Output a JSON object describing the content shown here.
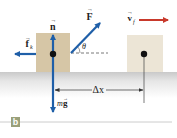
{
  "figure": {
    "part_label": "b",
    "colors": {
      "force_arrow": "#1f5fa8",
      "velocity_arrow": "#c8392b",
      "block_initial": "#d6c6a6",
      "block_final": "#ece5d6",
      "ground_top": "#cfcfcf",
      "badge": "#9aa07a",
      "rule_line": "#cccccc"
    },
    "vectors": {
      "normal": {
        "symbol": "n",
        "arrow": "→"
      },
      "applied": {
        "symbol": "F",
        "arrow": "→"
      },
      "friction": {
        "symbol": "f",
        "subscript": "k",
        "arrow": "→"
      },
      "gravity": {
        "prefix": "m",
        "symbol": "g",
        "arrow": "→"
      },
      "velocity_final": {
        "symbol": "v",
        "subscript": "f",
        "arrow": "→"
      }
    },
    "angle_label": "θ",
    "displacement_label": "Δx"
  }
}
